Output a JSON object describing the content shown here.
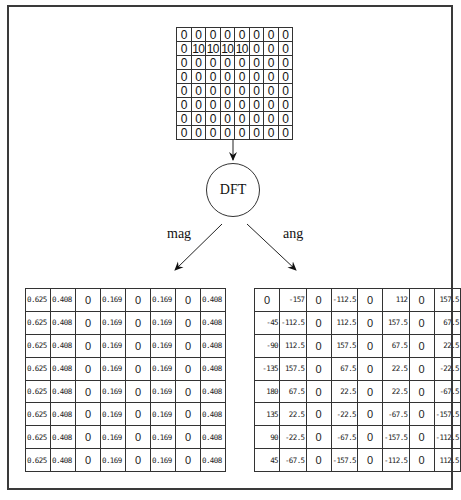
{
  "input_matrix": {
    "rows": [
      [
        "0",
        "0",
        "0",
        "0",
        "0",
        "0",
        "0",
        "0"
      ],
      [
        "0",
        "10",
        "10",
        "10",
        "10",
        "0",
        "0",
        "0"
      ],
      [
        "0",
        "0",
        "0",
        "0",
        "0",
        "0",
        "0",
        "0"
      ],
      [
        "0",
        "0",
        "0",
        "0",
        "0",
        "0",
        "0",
        "0"
      ],
      [
        "0",
        "0",
        "0",
        "0",
        "0",
        "0",
        "0",
        "0"
      ],
      [
        "0",
        "0",
        "0",
        "0",
        "0",
        "0",
        "0",
        "0"
      ],
      [
        "0",
        "0",
        "0",
        "0",
        "0",
        "0",
        "0",
        "0"
      ],
      [
        "0",
        "0",
        "0",
        "0",
        "0",
        "0",
        "0",
        "0"
      ]
    ]
  },
  "transform": {
    "label": "DFT"
  },
  "branches": {
    "left_label": "mag",
    "right_label": "ang"
  },
  "magnitude_matrix": {
    "rows": [
      [
        "0.625",
        "0.408",
        "0",
        "0.169",
        "0",
        "0.169",
        "0",
        "0.408"
      ],
      [
        "0.625",
        "0.408",
        "0",
        "0.169",
        "0",
        "0.169",
        "0",
        "0.408"
      ],
      [
        "0.625",
        "0.408",
        "0",
        "0.169",
        "0",
        "0.169",
        "0",
        "0.408"
      ],
      [
        "0.625",
        "0.408",
        "0",
        "0.169",
        "0",
        "0.169",
        "0",
        "0.408"
      ],
      [
        "0.625",
        "0.408",
        "0",
        "0.169",
        "0",
        "0.169",
        "0",
        "0.408"
      ],
      [
        "0.625",
        "0.408",
        "0",
        "0.169",
        "0",
        "0.169",
        "0",
        "0.408"
      ],
      [
        "0.625",
        "0.408",
        "0",
        "0.169",
        "0",
        "0.169",
        "0",
        "0.408"
      ],
      [
        "0.625",
        "0.408",
        "0",
        "0.169",
        "0",
        "0.169",
        "0",
        "0.408"
      ]
    ]
  },
  "angle_matrix": {
    "rows": [
      [
        "0",
        "-157",
        "0",
        "-112.5",
        "0",
        "112",
        "0",
        "157.5"
      ],
      [
        "-45",
        "-112.5",
        "0",
        "112.5",
        "0",
        "157.5",
        "0",
        "67.5"
      ],
      [
        "-90",
        "112.5",
        "0",
        "157.5",
        "0",
        "67.5",
        "0",
        "22.5"
      ],
      [
        "-135",
        "157.5",
        "0",
        "67.5",
        "0",
        "22.5",
        "0",
        "-22.5"
      ],
      [
        "180",
        "67.5",
        "0",
        "22.5",
        "0",
        "22.5",
        "0",
        "-67.5"
      ],
      [
        "135",
        "22.5",
        "0",
        "-22.5",
        "0",
        "-67.5",
        "0",
        "-157.5"
      ],
      [
        "90",
        "-22.5",
        "0",
        "-67.5",
        "0",
        "-157.5",
        "0",
        "-112.5"
      ],
      [
        "45",
        "-67.5",
        "0",
        "-157.5",
        "0",
        "-112.5",
        "0",
        "112.5"
      ]
    ]
  },
  "colors": {
    "line": "#333333",
    "background": "#ffffff",
    "text": "#111111"
  }
}
